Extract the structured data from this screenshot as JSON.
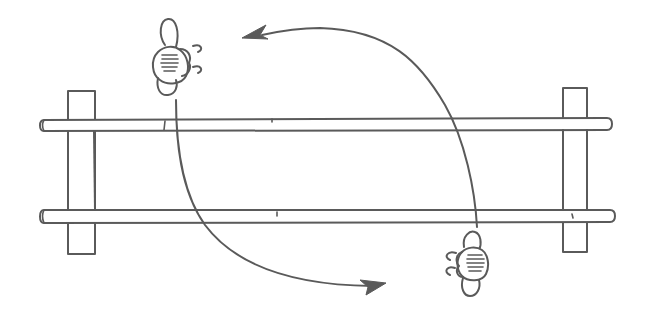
{
  "diagram": {
    "type": "line-drawing",
    "colors": {
      "stroke": "#5a5a5a",
      "background": "#ffffff"
    },
    "elements": {
      "posts": [
        {
          "id": "left-post",
          "x": 68,
          "y": 91,
          "width": 27,
          "height": 163
        },
        {
          "id": "right-post",
          "x": 563,
          "y": 88,
          "width": 24,
          "height": 164
        }
      ],
      "bars": [
        {
          "id": "upper-bar",
          "x1": 40,
          "x2": 611,
          "y": 126,
          "thickness": 11
        },
        {
          "id": "lower-bar",
          "x1": 40,
          "x2": 614,
          "y": 216,
          "thickness": 11
        }
      ],
      "figures": [
        {
          "id": "figure-top-left",
          "x": 150,
          "y": 20,
          "facing": "right"
        },
        {
          "id": "figure-bottom-right",
          "x": 442,
          "y": 230,
          "facing": "left"
        }
      ],
      "arrows": [
        {
          "id": "arrow-top",
          "from": "figure-bottom-right",
          "direction": "left",
          "head": [
            245,
            37
          ]
        },
        {
          "id": "arrow-bottom",
          "from": "figure-top-left",
          "direction": "right",
          "head": [
            385,
            285
          ]
        }
      ]
    }
  }
}
